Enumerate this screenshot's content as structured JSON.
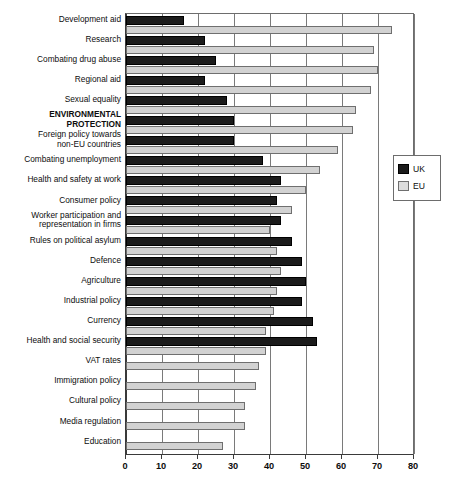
{
  "chart_data": {
    "type": "bar",
    "orientation": "horizontal",
    "title": "",
    "subtitle": "",
    "xlabel": "",
    "ylabel": "",
    "xlim": [
      0,
      80
    ],
    "xticks": [
      0,
      10,
      20,
      30,
      40,
      50,
      60,
      70,
      80
    ],
    "xtick_labels": [
      "0",
      "10",
      "20",
      "30",
      "40",
      "50",
      "60",
      "70",
      "80"
    ],
    "grid": true,
    "grid_axis": "x",
    "legend": {
      "position": "right",
      "entries": [
        {
          "name": "UK",
          "color": "#1b1b1b"
        },
        {
          "name": "EU",
          "color": "#d2d2d2"
        }
      ]
    },
    "categories": [
      "Development aid",
      "Research",
      "Combating drug abuse",
      "Regional aid",
      "Sexual equality",
      "ENVIRONMENTAL PROTECTION",
      "Foreign policy towards non-EU countries",
      "Combating unemployment",
      "Health and safety at work",
      "Consumer policy",
      "Worker participation and representation in firms",
      "Rules on political asylum",
      "Defence",
      "Agriculture",
      "Industrial policy",
      "Currency",
      "Health and social security",
      "VAT rates",
      "Immigration policy",
      "Cultural policy",
      "Media regulation",
      "Education"
    ],
    "category_label_lines": [
      [
        "Development aid"
      ],
      [
        "Research"
      ],
      [
        "Combating drug abuse"
      ],
      [
        "Regional aid"
      ],
      [
        "Sexual equality"
      ],
      [
        "ENVIRONMENTAL",
        "PROTECTION"
      ],
      [
        "Foreign policy towards",
        "non-EU countries"
      ],
      [
        "Combating unemployment"
      ],
      [
        "Health and safety at work"
      ],
      [
        "Consumer policy"
      ],
      [
        "Worker participation and",
        "representation in firms"
      ],
      [
        "Rules on political asylum"
      ],
      [
        "Defence"
      ],
      [
        "Agriculture"
      ],
      [
        "Industrial policy"
      ],
      [
        "Currency"
      ],
      [
        "Health and social security"
      ],
      [
        "VAT rates"
      ],
      [
        "Immigration policy"
      ],
      [
        "Cultural policy"
      ],
      [
        "Media regulation"
      ],
      [
        "Education"
      ]
    ],
    "emphasis_category_index": 5,
    "series": [
      {
        "name": "UK",
        "color": "#1b1b1b",
        "values": [
          16,
          22,
          25,
          22,
          28,
          30,
          30,
          38,
          43,
          42,
          43,
          46,
          49,
          50,
          49,
          52,
          53,
          null,
          null,
          null,
          null,
          null
        ]
      },
      {
        "name": "EU",
        "color": "#d2d2d2",
        "values": [
          74,
          69,
          70,
          68,
          64,
          63,
          59,
          54,
          50,
          46,
          40,
          42,
          43,
          42,
          41,
          39,
          39,
          37,
          36,
          33,
          33,
          27
        ]
      }
    ]
  }
}
